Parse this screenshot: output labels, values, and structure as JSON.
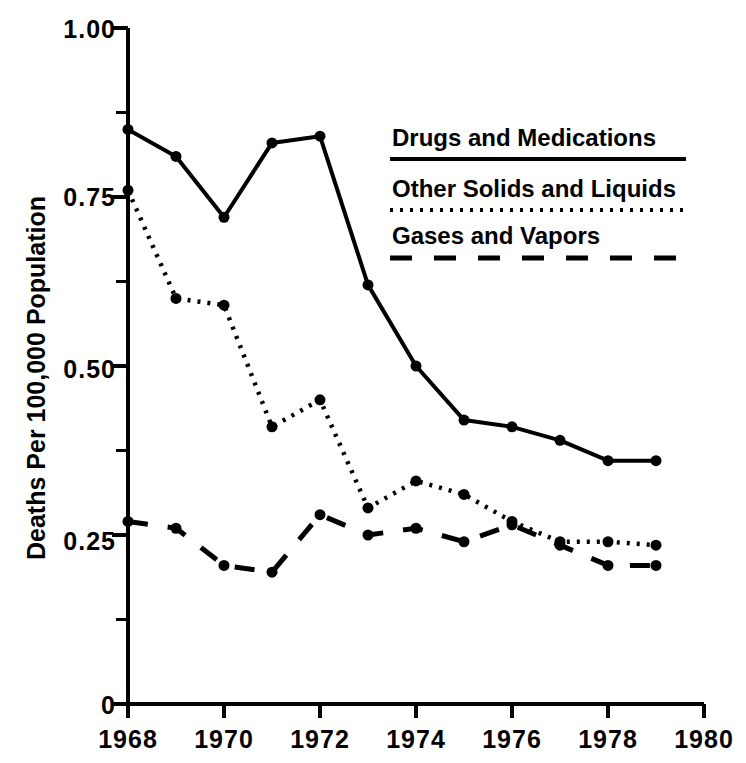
{
  "chart_data": {
    "type": "line",
    "title": "",
    "xlabel": "",
    "ylabel": "Deaths Per 100,000 Population",
    "x": [
      1968,
      1969,
      1970,
      1971,
      1972,
      1973,
      1974,
      1975,
      1976,
      1977,
      1978,
      1979
    ],
    "xlim": [
      1968,
      1980
    ],
    "ylim": [
      0,
      1.0
    ],
    "xticks": [
      1968,
      1970,
      1972,
      1974,
      1976,
      1978,
      1980
    ],
    "xtick_labels": [
      "1968",
      "1970",
      "1972",
      "1974",
      "1976",
      "1978",
      "1980"
    ],
    "yticks": [
      0,
      0.25,
      0.5,
      0.75,
      1.0
    ],
    "ytick_labels": [
      "0",
      "0.25",
      "0.50",
      "0.75",
      "1.00"
    ],
    "yminorticks": [
      0.125,
      0.375,
      0.625,
      0.875
    ],
    "grid": false,
    "legend_position": "upper right",
    "series": [
      {
        "name": "Drugs and Medications",
        "style": "solid",
        "values": [
          0.85,
          0.81,
          0.72,
          0.83,
          0.84,
          0.62,
          0.5,
          0.42,
          0.41,
          0.39,
          0.36,
          0.36
        ]
      },
      {
        "name": "Other Solids and Liquids",
        "style": "dotted",
        "values": [
          0.76,
          0.6,
          0.59,
          0.41,
          0.45,
          0.29,
          0.33,
          0.31,
          0.27,
          0.24,
          0.24,
          0.235
        ]
      },
      {
        "name": "Gases and Vapors",
        "style": "dashed",
        "values": [
          0.27,
          0.26,
          0.205,
          0.195,
          0.28,
          0.25,
          0.26,
          0.24,
          0.265,
          0.235,
          0.205,
          0.205
        ]
      }
    ]
  },
  "legend": {
    "items": [
      {
        "label": "Drugs and Medications",
        "style": "solid"
      },
      {
        "label": "Other Solids and Liquids",
        "style": "dotted"
      },
      {
        "label": "Gases and Vapors",
        "style": "dashed"
      }
    ]
  },
  "axes": {
    "y_title": "Deaths Per 100,000 Population",
    "y_labels": [
      "1.00",
      "0.75",
      "0.50",
      "0.25",
      "0"
    ],
    "x_labels": [
      "1968",
      "1970",
      "1972",
      "1974",
      "1976",
      "1978",
      "1980"
    ]
  }
}
